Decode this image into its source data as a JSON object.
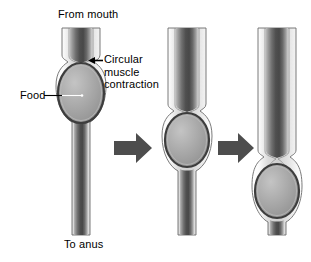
{
  "figure": {
    "type": "diagram",
    "background_color": "#ffffff",
    "panel_count": 3,
    "labels": {
      "from_mouth": "From mouth",
      "to_anus": "To anus",
      "food": "Food",
      "circular_muscle_contraction": "Circular\nmuscle\ncontraction"
    },
    "colors": {
      "outline": "#3a3a3a",
      "wall_light": "#f2f2f2",
      "wall_mid": "#c8c8c8",
      "lumen_dark": "#5a5a5a",
      "lumen_darkest": "#4a4a4a",
      "bolus_fill": "#a8a8a8",
      "bolus_outline": "#404040",
      "arrow_fill": "#4d4d4d",
      "text": "#000000"
    },
    "panels": [
      {
        "name": "panel-1",
        "sequence": 1,
        "bolus_position": "upper",
        "constriction_y": 62,
        "bolus_center_y": 93,
        "annotated": true
      },
      {
        "name": "panel-2",
        "sequence": 2,
        "bolus_position": "middle",
        "constriction_y": 112,
        "bolus_center_y": 140,
        "annotated": false
      },
      {
        "name": "panel-3",
        "sequence": 3,
        "bolus_position": "lower",
        "constriction_y": 158,
        "bolus_center_y": 191,
        "annotated": false
      }
    ],
    "arrows": [
      {
        "name": "progress-arrow-1",
        "direction": "right",
        "between": [
          1,
          2
        ]
      },
      {
        "name": "progress-arrow-2",
        "direction": "right",
        "between": [
          2,
          3
        ]
      }
    ],
    "pointer": {
      "name": "circular-muscle-pointer",
      "direction": "left",
      "points_to": "constriction"
    },
    "leader": {
      "name": "food-leader-line",
      "direction": "right",
      "points_to": "bolus-center"
    }
  }
}
